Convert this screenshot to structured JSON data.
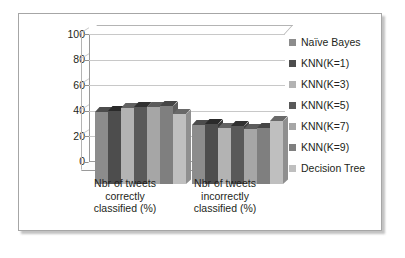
{
  "chart_data": {
    "type": "bar",
    "title": "",
    "subtitle": "",
    "xlabel": "",
    "ylabel": "",
    "ylim": [
      0,
      100
    ],
    "ytick_labels": [
      "100",
      "80",
      "60",
      "40",
      "20",
      "0"
    ],
    "ytick_values": [
      100,
      80,
      60,
      40,
      20,
      0
    ],
    "grid": true,
    "legend_position": "right",
    "style": "3d-clustered-column",
    "categories": [
      "Nbr of tweets correctly classified (%)",
      "Nbr of tweets incorrectly classified (%)"
    ],
    "category_lines": [
      [
        "Nbr of tweets",
        "correctly",
        "classified (%)"
      ],
      [
        "Nbr of tweets",
        "incorrectly",
        "classified (%)"
      ]
    ],
    "series": [
      {
        "name": "Naïve Bayes",
        "color": "#8c8c8c",
        "values": [
          56,
          46
        ]
      },
      {
        "name": "KNN(K=1)",
        "color": "#4d4d4d",
        "values": [
          57,
          47
        ]
      },
      {
        "name": "KNN(K=3)",
        "color": "#b3b3b3",
        "values": [
          59,
          44
        ]
      },
      {
        "name": "KNN(K=5)",
        "color": "#595959",
        "values": [
          60,
          45
        ]
      },
      {
        "name": "KNN(K=7)",
        "color": "#a6a6a6",
        "values": [
          60,
          43
        ]
      },
      {
        "name": "KNN(K=9)",
        "color": "#7f7f7f",
        "values": [
          61,
          44
        ]
      },
      {
        "name": "Decision Tree",
        "color": "#bfbfbf",
        "values": [
          55,
          49
        ]
      }
    ]
  },
  "legend": {
    "items": [
      {
        "label": "Naïve Bayes",
        "swatch": "#8c8c8c"
      },
      {
        "label": "KNN(K=1)",
        "swatch": "#4d4d4d"
      },
      {
        "label": "KNN(K=3)",
        "swatch": "#b3b3b3"
      },
      {
        "label": "KNN(K=5)",
        "swatch": "#595959"
      },
      {
        "label": "KNN(K=7)",
        "swatch": "#a6a6a6"
      },
      {
        "label": "KNN(K=9)",
        "swatch": "#7f7f7f"
      },
      {
        "label": "Decision Tree",
        "swatch": "#bfbfbf"
      }
    ]
  },
  "colors": {
    "plot_background": "#ffffff",
    "frame_border": "#a6a6a6",
    "gridline": "#c8c8c8",
    "axis": "#9a9a9a",
    "text": "#231f20"
  }
}
